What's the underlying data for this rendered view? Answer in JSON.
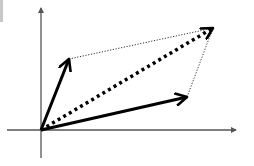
{
  "diagram": {
    "origin": [
      41,
      130
    ],
    "axes": {
      "x_axis": {
        "from": [
          7,
          130
        ],
        "to": [
          236,
          130
        ],
        "color": "#555555"
      },
      "y_axis": {
        "from": [
          41,
          158
        ],
        "to": [
          41,
          8
        ],
        "color": "#555555"
      }
    },
    "vectors": [
      {
        "name": "vector-a",
        "from": [
          41,
          130
        ],
        "to": [
          69,
          59
        ],
        "style": "solid",
        "color": "#000000",
        "width": 3
      },
      {
        "name": "vector-b",
        "from": [
          41,
          130
        ],
        "to": [
          187,
          97
        ],
        "style": "solid",
        "color": "#000000",
        "width": 3
      },
      {
        "name": "resultant",
        "from": [
          41,
          130
        ],
        "to": [
          213,
          28
        ],
        "style": "dotted-thick",
        "color": "#000000",
        "width": 3.5
      }
    ],
    "construction_lines": [
      {
        "name": "parallel-a-to-tip",
        "from": [
          69,
          59
        ],
        "to": [
          213,
          28
        ],
        "style": "dotted-thin",
        "color": "#333333"
      },
      {
        "name": "parallel-b-to-tip",
        "from": [
          187,
          97
        ],
        "to": [
          213,
          28
        ],
        "style": "dotted-thin",
        "color": "#333333"
      }
    ],
    "edge_artifact": {
      "color": "#c8c8c8"
    }
  }
}
